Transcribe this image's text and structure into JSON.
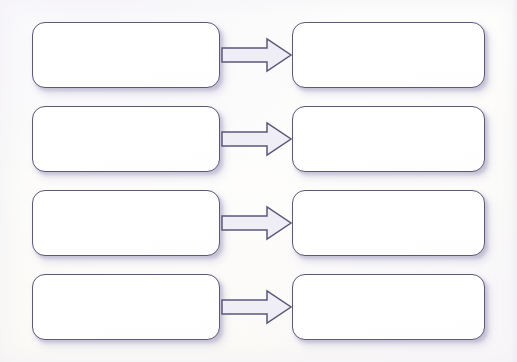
{
  "diagram": {
    "type": "flow-diagram",
    "background_color": "#fdfdfb",
    "stroke_color": "#5b5878",
    "arrow_fill_color": "#efeef6",
    "node_fill_color": "#ffffff",
    "shadow_color": "#b2adcd",
    "row_count": 4,
    "columns": [
      "left",
      "right"
    ],
    "connector_label": "arrow-right",
    "rows": [
      {
        "index": 1,
        "left_box": {
          "label": "",
          "name": "left-box-1"
        },
        "arrow": {
          "label": "",
          "name": "arrow-1",
          "direction": "right"
        },
        "right_box": {
          "label": "",
          "name": "right-box-1"
        }
      },
      {
        "index": 2,
        "left_box": {
          "label": "",
          "name": "left-box-2"
        },
        "arrow": {
          "label": "",
          "name": "arrow-2",
          "direction": "right"
        },
        "right_box": {
          "label": "",
          "name": "right-box-2"
        }
      },
      {
        "index": 3,
        "left_box": {
          "label": "",
          "name": "left-box-3"
        },
        "arrow": {
          "label": "",
          "name": "arrow-3",
          "direction": "right"
        },
        "right_box": {
          "label": "",
          "name": "right-box-3"
        }
      },
      {
        "index": 4,
        "left_box": {
          "label": "",
          "name": "left-box-4"
        },
        "arrow": {
          "label": "",
          "name": "arrow-4",
          "direction": "right"
        },
        "right_box": {
          "label": "",
          "name": "right-box-4"
        }
      }
    ]
  }
}
